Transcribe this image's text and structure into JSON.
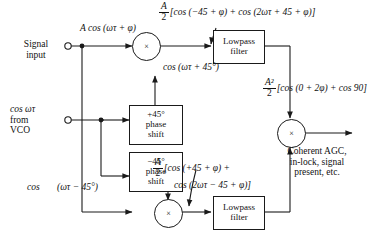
{
  "diagram": {
    "inputs": {
      "signal_input": "Signal\ninput",
      "signal_input_line1": "Signal",
      "signal_input_line2": "input",
      "vco_line1": "cos ωτ",
      "vco_line2": "from",
      "vco_line3": "VCO"
    },
    "blocks": {
      "phase_plus": {
        "line1": "+45°",
        "line2": "phase",
        "line3": "shift"
      },
      "phase_minus": {
        "line1": "−45°",
        "line2": "phase",
        "line3": "shift"
      },
      "lowpass_top": {
        "line1": "Lowpass",
        "line2": "filter"
      },
      "lowpass_bottom": {
        "line1": "Lowpass",
        "line2": "filter"
      },
      "multiplier_symbol": "×"
    },
    "labels": {
      "input_signal_expr": "A cos (ωτ + φ)",
      "top_lo_expr": "cos (ωτ + 45°)",
      "bottom_lo_cos": "cos",
      "bottom_lo_arg": "(ωτ − 45°)",
      "output_line1": "Coherent AGC,",
      "output_line2": "in-lock, signal",
      "output_line3": "present, etc."
    },
    "equations": {
      "top": {
        "num": "A",
        "den": "2",
        "body": "[cos (−45 + φ) + cos (2ωτ + 45 + φ)]"
      },
      "bottom": {
        "num": "A",
        "den": "2",
        "body_line1": "[cos (+45 + φ) +",
        "body_line2": "cos (2ωτ − 45 + φ)]"
      },
      "right": {
        "num": "A²",
        "den": "2",
        "body": "[cos (0 + 2φ) + cos 90]"
      }
    },
    "colors": {
      "line": "#1a1a1a",
      "background": "#ffffff",
      "text": "#111111"
    }
  }
}
